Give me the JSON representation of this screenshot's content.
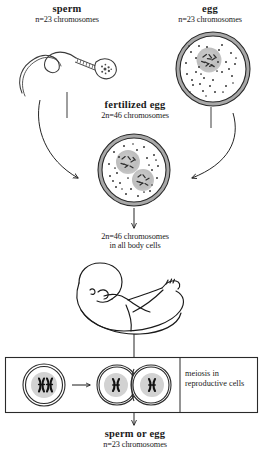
{
  "diagram": {
    "accent_color": "#1a1a1a",
    "membrane_color": "#9a9a9a",
    "nucleus_color": "#b5b5b5",
    "background_color": "#ffffff"
  },
  "sperm": {
    "title": "sperm",
    "subtitle": "n=23 chromosomes",
    "icon": "sperm-cell-icon"
  },
  "egg": {
    "title": "egg",
    "subtitle": "n=23 chromosomes",
    "icon": "egg-cell-icon"
  },
  "fertilized_egg": {
    "title": "fertilized egg",
    "subtitle": "2n=46 chromosomes",
    "icon": "zygote-cell-icon"
  },
  "body_cells": {
    "line1": "2n=46 chromosomes",
    "line2": "in all body cells",
    "icon": "fetus-icon"
  },
  "meiosis_box": {
    "caption_line1": "meiosis in",
    "caption_line2": "reproductive cells",
    "parent_cell_icon": "diploid-cell-icon",
    "daughter_cells_icon": "haploid-cell-pair-icon",
    "arrow_icon": "right-arrow-icon"
  },
  "gamete_output": {
    "title": "sperm or egg",
    "subtitle": "n=23 chromosomes"
  },
  "arrows": {
    "sperm_to_zygote": "curved-arrow-icon",
    "egg_to_zygote": "curved-arrow-icon",
    "zygote_to_body": "down-arrow-icon",
    "body_to_meiosis": "down-connector-icon",
    "meiosis_to_gamete": "down-arrow-icon"
  }
}
